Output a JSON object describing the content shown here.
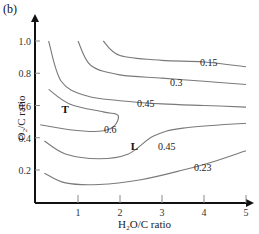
{
  "panel_label": "(b)",
  "chart_data": {
    "type": "contour",
    "title": "",
    "xlabel": "H2O/C ratio",
    "xlabel_display": "H₂O/C ratio",
    "ylabel": "O2/C ratio",
    "ylabel_display": "O₂/C ratio",
    "xlim": [
      0.1,
      5.1
    ],
    "ylim": [
      0.0,
      1.15
    ],
    "x_ticks": [
      1,
      2,
      3,
      4,
      5
    ],
    "y_ticks": [
      0.2,
      0.4,
      0.6,
      0.8,
      1.0
    ],
    "y_tick_labels": [
      "0.2",
      "0.4",
      "0.6",
      "0.8",
      "1.0"
    ],
    "grid": false,
    "legend": null,
    "contours": [
      {
        "level": "0.15",
        "points": [
          [
            1.6,
            1.0
          ],
          [
            2.0,
            0.91
          ],
          [
            3.0,
            0.88
          ],
          [
            4.0,
            0.87
          ],
          [
            5.0,
            0.84
          ]
        ]
      },
      {
        "level": "0.3",
        "points": [
          [
            1.0,
            1.0
          ],
          [
            1.3,
            0.85
          ],
          [
            2.0,
            0.79
          ],
          [
            3.0,
            0.77
          ],
          [
            4.0,
            0.75
          ],
          [
            5.0,
            0.73
          ]
        ]
      },
      {
        "level": "0.45",
        "points": [
          [
            0.3,
            1.0
          ],
          [
            0.6,
            0.75
          ],
          [
            1.2,
            0.66
          ],
          [
            2.0,
            0.63
          ],
          [
            3.0,
            0.61
          ],
          [
            4.0,
            0.6
          ],
          [
            5.0,
            0.59
          ]
        ]
      },
      {
        "level": "0.6",
        "points": [
          [
            0.3,
            0.7
          ],
          [
            0.8,
            0.61
          ],
          [
            1.6,
            0.56
          ],
          [
            1.95,
            0.54
          ],
          [
            1.85,
            0.47
          ],
          [
            1.5,
            0.44
          ],
          [
            0.8,
            0.45
          ],
          [
            0.1,
            0.48
          ]
        ]
      },
      {
        "level": "0.45",
        "points": [
          [
            0.2,
            0.38
          ],
          [
            0.7,
            0.3
          ],
          [
            1.5,
            0.27
          ],
          [
            2.2,
            0.3
          ],
          [
            2.8,
            0.41
          ],
          [
            3.5,
            0.46
          ],
          [
            5.0,
            0.49
          ]
        ]
      },
      {
        "level": "0.23",
        "points": [
          [
            0.2,
            0.18
          ],
          [
            0.7,
            0.12
          ],
          [
            1.5,
            0.11
          ],
          [
            2.5,
            0.14
          ],
          [
            3.5,
            0.2
          ],
          [
            4.2,
            0.25
          ],
          [
            5.0,
            0.32
          ]
        ]
      }
    ],
    "annotations": [
      {
        "text": "T",
        "x": 0.7,
        "y": 0.58
      },
      {
        "text": "L",
        "x": 2.35,
        "y": 0.35
      }
    ]
  }
}
